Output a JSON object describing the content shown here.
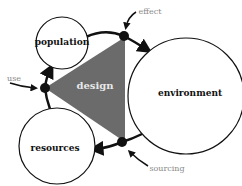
{
  "diagram": {
    "nodes": [
      {
        "id": "population",
        "label": "population"
      },
      {
        "id": "environment",
        "label": "environment"
      },
      {
        "id": "resources",
        "label": "resources"
      }
    ],
    "center": {
      "label": "design"
    },
    "annotations": [
      {
        "id": "effect",
        "label": "effect"
      },
      {
        "id": "use",
        "label": "use"
      },
      {
        "id": "sourcing",
        "label": "sourcing"
      }
    ],
    "colors": {
      "triangle": "#6b6b6b",
      "annotation": "#888888",
      "stroke": "#111111"
    }
  }
}
